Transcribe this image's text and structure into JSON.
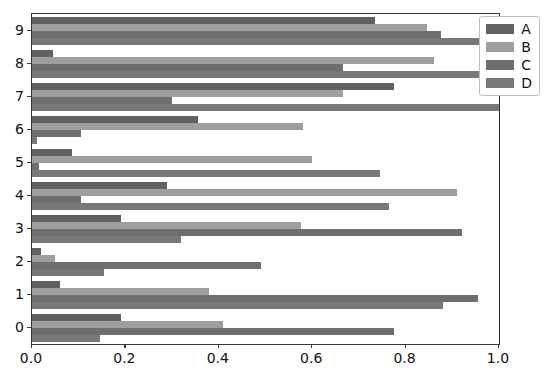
{
  "chart_data": {
    "type": "bar",
    "orientation": "horizontal",
    "title": "",
    "xlabel": "",
    "ylabel": "",
    "xlim": [
      0.0,
      1.0
    ],
    "grid": false,
    "legend_position": "upper right",
    "categories": [
      "0",
      "1",
      "2",
      "3",
      "4",
      "5",
      "6",
      "7",
      "8",
      "9"
    ],
    "xticks": [
      "0.0",
      "0.2",
      "0.4",
      "0.6",
      "0.8",
      "1.0"
    ],
    "xtick_values": [
      0.0,
      0.2,
      0.4,
      0.6,
      0.8,
      1.0
    ],
    "series": [
      {
        "name": "A",
        "color": "#616161",
        "values": [
          0.19,
          0.06,
          0.02,
          0.19,
          0.29,
          0.085,
          0.355,
          0.775,
          0.045,
          0.735
        ]
      },
      {
        "name": "B",
        "color": "#9e9e9e",
        "values": [
          0.41,
          0.38,
          0.05,
          0.575,
          0.91,
          0.6,
          0.58,
          0.665,
          0.86,
          0.845
        ]
      },
      {
        "name": "C",
        "color": "#6e6e6e",
        "values": [
          0.775,
          0.955,
          0.49,
          0.92,
          0.105,
          0.015,
          0.105,
          0.3,
          0.665,
          0.875
        ]
      },
      {
        "name": "D",
        "color": "#787878",
        "values": [
          0.145,
          0.88,
          0.155,
          0.32,
          0.765,
          0.745,
          0.01,
          1.0,
          1.0,
          1.0
        ]
      }
    ]
  },
  "legend": {
    "entries": [
      {
        "label": "A"
      },
      {
        "label": "B"
      },
      {
        "label": "C"
      },
      {
        "label": "D"
      }
    ]
  },
  "colors": {
    "axis": "#3a3a3a",
    "text": "#111111",
    "background": "#ffffff",
    "legend_border": "#bfbfbf"
  }
}
